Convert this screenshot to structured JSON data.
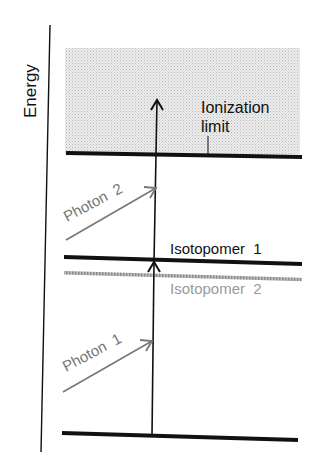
{
  "diagram": {
    "axis_label": "Energy",
    "levels": {
      "ionization_limit": "Ionization",
      "ionization_limit_line2": "limit",
      "isotopomer_1": "Isotopomer  1",
      "isotopomer_2": "Isotopomer  2"
    },
    "photons": {
      "photon_1": "Photon  1",
      "photon_2": "Photon  2"
    },
    "colors": {
      "line": "#111111",
      "photon": "#777777",
      "isotopomer_2": "#9a9a9a",
      "continuum_fill": "#e4e4e4"
    }
  }
}
